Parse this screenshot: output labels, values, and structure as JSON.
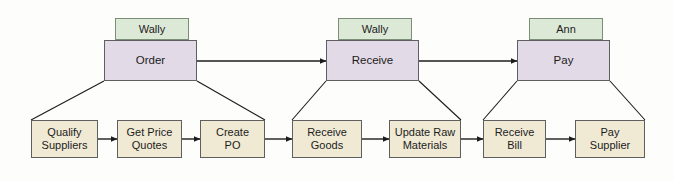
{
  "diagram": {
    "type": "process-flow",
    "colors": {
      "role_fill": "#dde9d7",
      "role_stroke": "#7b8f76",
      "process_fill": "#e2dae6",
      "process_stroke": "#5f5f5f",
      "task_fill": "#f0ead4",
      "task_stroke": "#5f5f5f",
      "connector": "#1c1c1c",
      "background": "#fdfdfc"
    },
    "roles": [
      {
        "id": "role-order",
        "label": "Wally",
        "x": 115,
        "y": 18,
        "w": 74,
        "h": 22
      },
      {
        "id": "role-receive",
        "label": "Wally",
        "x": 338,
        "y": 18,
        "w": 74,
        "h": 22
      },
      {
        "id": "role-pay",
        "label": "Ann",
        "x": 529,
        "y": 18,
        "w": 74,
        "h": 22
      }
    ],
    "processes": [
      {
        "id": "process-order",
        "label": "Order",
        "x": 104,
        "y": 40,
        "w": 93,
        "h": 41
      },
      {
        "id": "process-receive",
        "label": "Receive",
        "x": 326,
        "y": 40,
        "w": 93,
        "h": 41
      },
      {
        "id": "process-pay",
        "label": "Pay",
        "x": 517,
        "y": 40,
        "w": 93,
        "h": 41
      }
    ],
    "tasks": [
      {
        "id": "task-qualify-suppliers",
        "label": "Qualify\nSuppliers",
        "x": 31,
        "y": 120,
        "w": 67,
        "h": 38,
        "parent": "process-order"
      },
      {
        "id": "task-get-price-quotes",
        "label": "Get Price\nQuotes",
        "x": 117,
        "y": 120,
        "w": 65,
        "h": 38,
        "parent": "process-order"
      },
      {
        "id": "task-create-po",
        "label": "Create\nPO",
        "x": 200,
        "y": 120,
        "w": 65,
        "h": 38,
        "parent": "process-order"
      },
      {
        "id": "task-receive-goods",
        "label": "Receive\nGoods",
        "x": 292,
        "y": 120,
        "w": 70,
        "h": 38,
        "parent": "process-receive"
      },
      {
        "id": "task-update-raw-materials",
        "label": "Update Raw\nMaterials",
        "x": 389,
        "y": 120,
        "w": 72,
        "h": 38,
        "parent": "process-receive"
      },
      {
        "id": "task-receive-bill",
        "label": "Receive\nBill",
        "x": 483,
        "y": 120,
        "w": 63,
        "h": 38,
        "parent": "process-pay"
      },
      {
        "id": "task-pay-supplier",
        "label": "Pay\nSupplier",
        "x": 575,
        "y": 120,
        "w": 70,
        "h": 38,
        "parent": "process-pay"
      }
    ],
    "process_arrows": [
      {
        "id": "arrow-order-to-receive",
        "from": "process-order",
        "to": "process-receive",
        "x1": 197,
        "y1": 61,
        "x2": 326,
        "y2": 61
      },
      {
        "id": "arrow-receive-to-pay",
        "from": "process-receive",
        "to": "process-pay",
        "x1": 419,
        "y1": 61,
        "x2": 517,
        "y2": 61
      }
    ],
    "task_arrows": [
      {
        "id": "arrow-qualify-to-quotes",
        "x1": 98,
        "y1": 139,
        "x2": 117,
        "y2": 139
      },
      {
        "id": "arrow-quotes-to-po",
        "x1": 182,
        "y1": 139,
        "x2": 200,
        "y2": 139
      },
      {
        "id": "arrow-po-to-goods",
        "x1": 265,
        "y1": 139,
        "x2": 292,
        "y2": 139
      },
      {
        "id": "arrow-goods-to-materials",
        "x1": 362,
        "y1": 139,
        "x2": 389,
        "y2": 139
      },
      {
        "id": "arrow-materials-to-bill",
        "x1": 461,
        "y1": 139,
        "x2": 483,
        "y2": 139
      },
      {
        "id": "arrow-bill-to-pay-supplier",
        "x1": 546,
        "y1": 139,
        "x2": 575,
        "y2": 139
      }
    ],
    "decomposition_lines": [
      {
        "id": "decomp-order-left",
        "x1": 104,
        "y1": 81,
        "x2": 31,
        "y2": 120
      },
      {
        "id": "decomp-order-right",
        "x1": 197,
        "y1": 81,
        "x2": 265,
        "y2": 120
      },
      {
        "id": "decomp-receive-left",
        "x1": 326,
        "y1": 81,
        "x2": 292,
        "y2": 120
      },
      {
        "id": "decomp-receive-right",
        "x1": 419,
        "y1": 81,
        "x2": 461,
        "y2": 120
      },
      {
        "id": "decomp-pay-left",
        "x1": 517,
        "y1": 81,
        "x2": 483,
        "y2": 120
      },
      {
        "id": "decomp-pay-right",
        "x1": 610,
        "y1": 81,
        "x2": 645,
        "y2": 120
      }
    ]
  }
}
